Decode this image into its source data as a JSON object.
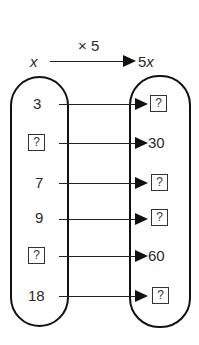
{
  "header": {
    "input_label": "x",
    "operation_label": "× 5",
    "output_label": "5x"
  },
  "mapping": {
    "rows": [
      {
        "input": "3",
        "output": "?"
      },
      {
        "input": "?",
        "output": "30"
      },
      {
        "input": "7",
        "output": "?"
      },
      {
        "input": "9",
        "output": "?"
      },
      {
        "input": "?",
        "output": "60"
      },
      {
        "input": "18",
        "output": "?"
      }
    ]
  },
  "colors": {
    "stroke": "#111111",
    "text": "#2a2a2a",
    "background": "#ffffff"
  }
}
